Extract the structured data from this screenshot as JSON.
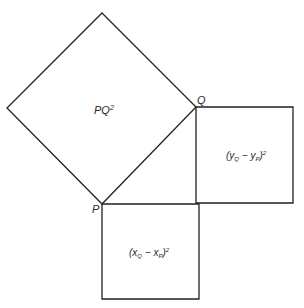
{
  "diagram": {
    "points": {
      "P": {
        "label": "P",
        "x": 102,
        "y": 204
      },
      "Q": {
        "label": "Q",
        "x": 196,
        "y": 107
      }
    },
    "squares": {
      "hypotenuse": {
        "label": "PQ²",
        "vertices": [
          [
            102,
            13
          ],
          [
            196,
            107
          ],
          [
            102,
            204
          ],
          [
            7,
            108
          ]
        ]
      },
      "vertical": {
        "label": "(y_Q − y_P)²",
        "vertices": [
          [
            196,
            107
          ],
          [
            293,
            107
          ],
          [
            293,
            203
          ],
          [
            196,
            203
          ]
        ]
      },
      "horizontal": {
        "label": "(x_Q − x_P)²",
        "vertices": [
          [
            102,
            204
          ],
          [
            199,
            204
          ],
          [
            199,
            299
          ],
          [
            102,
            299
          ]
        ]
      }
    },
    "labels": {
      "P": "P",
      "Q": "Q",
      "pq_main": "PQ",
      "pq_sup": "2",
      "y_open": "(y",
      "y_sub_q": "Q",
      "y_minus": " − y",
      "y_sub_p": "P",
      "y_close": ")",
      "y_sup": "2",
      "x_open": "(x",
      "x_sub_q": "Q",
      "x_minus": " − x",
      "x_sub_p": "P",
      "x_close": ")",
      "x_sup": "2"
    },
    "colors": {
      "stroke": "#222222",
      "text": "#2a2a2a",
      "background": "#ffffff"
    }
  }
}
